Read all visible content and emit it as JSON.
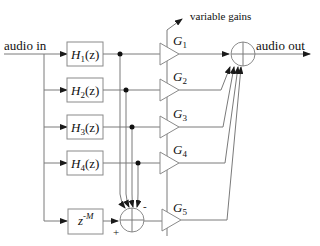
{
  "diagram": {
    "input_label": "audio in",
    "output_label": "audio out",
    "gain_control_label": "variable gains",
    "filters": [
      {
        "name": "H",
        "sub": "1",
        "arg": "(z)"
      },
      {
        "name": "H",
        "sub": "2",
        "arg": "(z)"
      },
      {
        "name": "H",
        "sub": "3",
        "arg": "(z)"
      },
      {
        "name": "H",
        "sub": "4",
        "arg": "(z)"
      }
    ],
    "delay": {
      "base": "z",
      "exp": "-M"
    },
    "gains": [
      {
        "name": "G",
        "sub": "1"
      },
      {
        "name": "G",
        "sub": "2"
      },
      {
        "name": "G",
        "sub": "3"
      },
      {
        "name": "G",
        "sub": "4"
      },
      {
        "name": "G",
        "sub": "5"
      }
    ],
    "difference_node": {
      "plus": "+",
      "minus": "-"
    }
  }
}
